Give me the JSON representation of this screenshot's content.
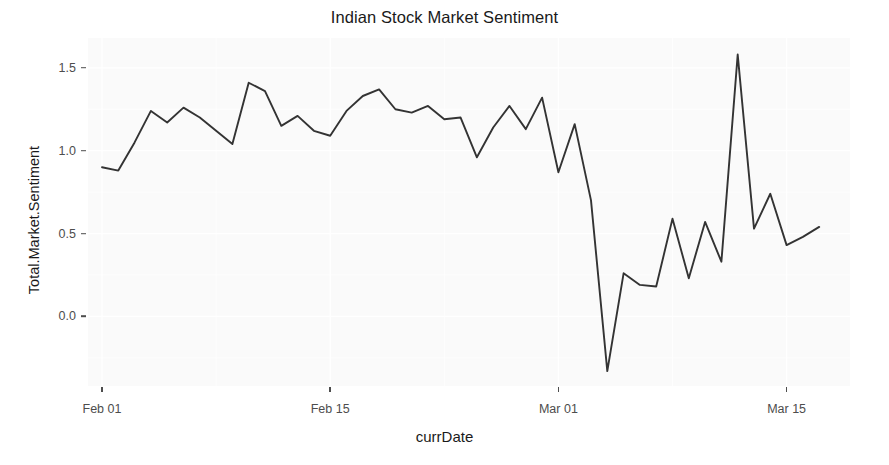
{
  "chart_data": {
    "type": "line",
    "title": "Indian Stock Market Sentiment",
    "xlabel": "currDate",
    "ylabel": "Total.Market.Sentiment",
    "grid": true,
    "legend": "none",
    "ylim": [
      -0.42,
      1.68
    ],
    "yticks": [
      0.0,
      0.5,
      1.0,
      1.5
    ],
    "ytick_labels": [
      "0.0",
      "0.5",
      "1.0",
      "1.5"
    ],
    "xticks": [
      "Feb 01",
      "Feb 15",
      "Mar 01",
      "Mar 15"
    ],
    "xtick_labels": [
      "Feb 01",
      "Feb 15",
      "Mar 01",
      "Mar 15"
    ],
    "xlim": [
      "Feb 01",
      "Mar 17"
    ],
    "series": [
      {
        "name": "Total.Market.Sentiment",
        "color": "#333333",
        "x": [
          "Feb 01",
          "Feb 02",
          "Feb 03",
          "Feb 04",
          "Feb 05",
          "Feb 06",
          "Feb 07",
          "Feb 08",
          "Feb 09",
          "Feb 10",
          "Feb 11",
          "Feb 12",
          "Feb 13",
          "Feb 14",
          "Feb 15",
          "Feb 16",
          "Feb 17",
          "Feb 18",
          "Feb 19",
          "Feb 20",
          "Feb 21",
          "Feb 22",
          "Feb 23",
          "Feb 24",
          "Feb 25",
          "Feb 26",
          "Feb 27",
          "Feb 28",
          "Mar 01",
          "Mar 02",
          "Mar 03",
          "Mar 04",
          "Mar 05",
          "Mar 06",
          "Mar 07",
          "Mar 08",
          "Mar 09",
          "Mar 10",
          "Mar 11",
          "Mar 12",
          "Mar 13",
          "Mar 14",
          "Mar 15",
          "Mar 16",
          "Mar 17"
        ],
        "values": [
          0.9,
          0.88,
          1.05,
          1.24,
          1.17,
          1.26,
          1.2,
          1.12,
          1.04,
          1.41,
          1.36,
          1.15,
          1.21,
          1.12,
          1.09,
          1.24,
          1.33,
          1.37,
          1.25,
          1.23,
          1.27,
          1.19,
          1.2,
          0.96,
          1.14,
          1.27,
          1.13,
          1.32,
          0.87,
          1.16,
          0.7,
          -0.33,
          0.26,
          0.19,
          0.18,
          0.59,
          0.23,
          0.57,
          0.33,
          1.58,
          0.53,
          0.74,
          0.43,
          0.48,
          0.54
        ]
      }
    ],
    "annotations": []
  },
  "figure": {
    "background_color": "#ffffff",
    "panel_color": "#fafafa",
    "grid_color": "#ffffff",
    "line_color": "#333333",
    "text_color": "#1a1a1a",
    "tick_color": "#4d4d4d"
  }
}
